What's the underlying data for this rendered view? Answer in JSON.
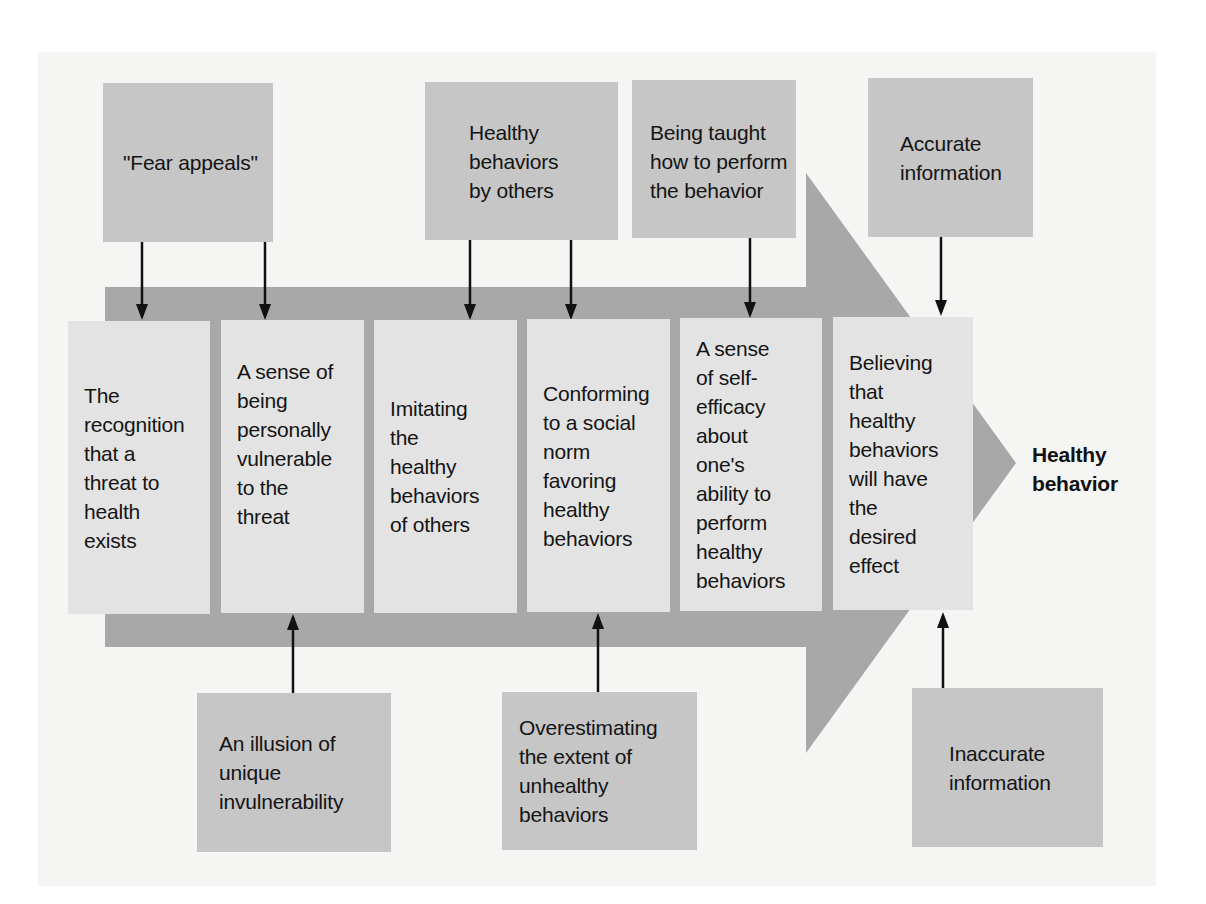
{
  "diagram": {
    "type": "flow",
    "direction": "left-to-right",
    "outcome": {
      "label": "Healthy\nbehavior"
    },
    "steps": [
      {
        "id": 1,
        "label": "The\nrecognition\nthat a\nthreat to\nhealth\nexists"
      },
      {
        "id": 2,
        "label": "A sense of\nbeing\npersonally\nvulnerable\nto the\nthreat"
      },
      {
        "id": 3,
        "label": "Imitating\nthe\nhealthy\nbehaviors\nof others"
      },
      {
        "id": 4,
        "label": "Conforming\nto a social\nnorm\nfavoring\nhealthy\nbehaviors"
      },
      {
        "id": 5,
        "label": "A sense\nof self-\nefficacy\nabout\none's\nability to\nperform\nhealthy\nbehaviors"
      },
      {
        "id": 6,
        "label": "Believing\nthat\nhealthy\nbehaviors\nwill have\nthe\ndesired\neffect"
      }
    ],
    "promoting_factors": [
      {
        "label": "\"Fear appeals\"",
        "targets": [
          1,
          2
        ]
      },
      {
        "label": "Healthy\nbehaviors\nby others",
        "targets": [
          3,
          4
        ]
      },
      {
        "label": "Being taught\nhow to perform\nthe behavior",
        "targets": [
          5
        ]
      },
      {
        "label": "Accurate\ninformation",
        "targets": [
          6
        ]
      }
    ],
    "inhibiting_factors": [
      {
        "label": "An illusion of\nunique\ninvulnerability",
        "targets": [
          2
        ]
      },
      {
        "label": "Overestimating\nthe extent of\nunhealthy\nbehaviors",
        "targets": [
          4
        ]
      },
      {
        "label": "Inaccurate\ninformation",
        "targets": [
          6
        ]
      }
    ],
    "colors": {
      "background_panel": "#f5f5f3",
      "factor_box": "#c6c6c6",
      "step_box": "#e3e3e3",
      "big_arrow": "#a8a8a8",
      "arrow_line": "#111111",
      "text": "#141414"
    }
  }
}
